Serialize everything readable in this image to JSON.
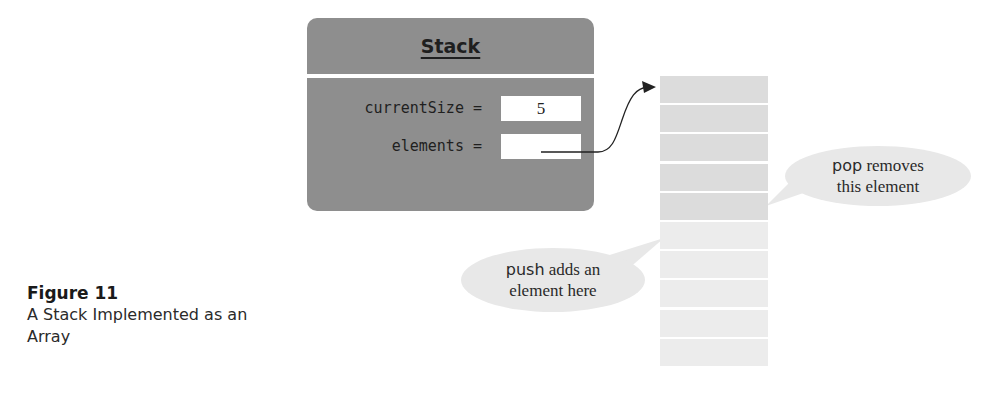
{
  "stack": {
    "title": "Stack",
    "fields": [
      {
        "label": "currentSize =",
        "value": "5"
      },
      {
        "label": "elements =",
        "value": ""
      }
    ]
  },
  "array": {
    "cell_count": 10,
    "filled_count": 5
  },
  "callouts": {
    "pop": {
      "code": "pop",
      "text_line1": " removes",
      "text_line2": "this element"
    },
    "push": {
      "code": "push",
      "text_line1": " adds an",
      "text_line2": "element here"
    }
  },
  "caption": {
    "title": "Figure 11",
    "text": "A Stack Implemented as an Array"
  },
  "colors": {
    "stack_box": "#8e8e8e",
    "filled_cell": "#dcdcdc",
    "empty_cell": "#ececec",
    "bubble": "#e8e8e8"
  }
}
